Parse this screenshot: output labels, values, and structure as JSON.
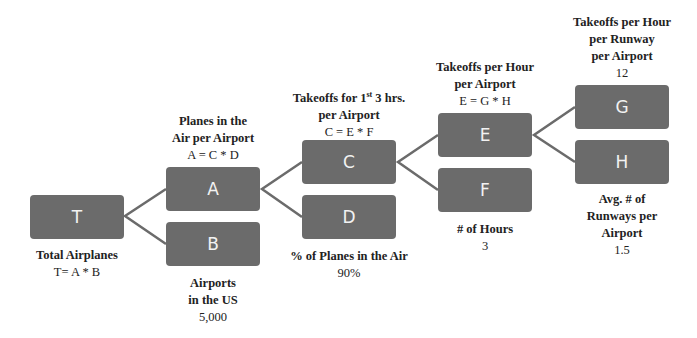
{
  "diagram": {
    "type": "driver-tree",
    "nodes": [
      {
        "id": "T",
        "letter": "T",
        "title": "Total Airplanes",
        "value": "T= A * B"
      },
      {
        "id": "A",
        "letter": "A",
        "title": "Planes in the\nAir per Airport",
        "value": "A = C * D"
      },
      {
        "id": "B",
        "letter": "B",
        "title": "Airports\nin the US",
        "value": "5,000"
      },
      {
        "id": "C",
        "letter": "C",
        "title_pre": "Takeoffs for 1",
        "title_sup": "st",
        "title_post": " 3 hrs.\nper Airport",
        "value": "C = E * F"
      },
      {
        "id": "D",
        "letter": "D",
        "title": "% of Planes in the Air",
        "value": "90%"
      },
      {
        "id": "E",
        "letter": "E",
        "title": "Takeoffs per Hour\nper Airport",
        "value": "E = G * H"
      },
      {
        "id": "F",
        "letter": "F",
        "title": "# of Hours",
        "value": "3"
      },
      {
        "id": "G",
        "letter": "G",
        "title": "Takeoffs per Hour\nper Runway\nper Airport",
        "value": "12"
      },
      {
        "id": "H",
        "letter": "H",
        "title": "Avg. # of\nRunways per\nAirport",
        "value": "1.5"
      }
    ],
    "edges": [
      [
        "T",
        "A"
      ],
      [
        "T",
        "B"
      ],
      [
        "A",
        "C"
      ],
      [
        "A",
        "D"
      ],
      [
        "C",
        "E"
      ],
      [
        "C",
        "F"
      ],
      [
        "E",
        "G"
      ],
      [
        "E",
        "H"
      ]
    ],
    "colors": {
      "box": "#6b6b6b",
      "box_text": "#f2f2f2",
      "line": "#6b6b6b",
      "label": "#222222"
    }
  }
}
